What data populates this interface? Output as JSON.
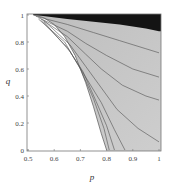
{
  "chart_data": {
    "type": "heatmap",
    "subtype": "contour",
    "title": "",
    "xlabel": "p",
    "ylabel": "q",
    "xlim": [
      0.5,
      1.0
    ],
    "ylim": [
      0.0,
      1.0
    ],
    "xticks": [
      "0.5",
      "0.6",
      "0.7",
      "0.8",
      "0.9",
      "1"
    ],
    "yticks": [
      "0",
      "0.2",
      "0.4",
      "0.6",
      "0.8",
      "1"
    ],
    "grid": false,
    "legend": null,
    "regions": [
      {
        "name": "empty-region",
        "color": "#ffffff",
        "description": "white region left of boundary curve"
      },
      {
        "name": "filled-region",
        "color": "#c4c4c4",
        "description": "gray contour-filled region"
      },
      {
        "name": "top-band",
        "color": "#141414",
        "description": "black band near q=1"
      }
    ],
    "boundary_curve": {
      "p": [
        0.52,
        0.56,
        0.6,
        0.64,
        0.68,
        0.72,
        0.75,
        0.78,
        0.8
      ],
      "q": [
        1.0,
        0.98,
        0.93,
        0.84,
        0.7,
        0.5,
        0.32,
        0.12,
        0.0
      ]
    },
    "black_band_lower_edge": {
      "p": [
        0.55,
        0.65,
        0.75,
        0.85,
        0.95,
        1.0
      ],
      "q": [
        0.995,
        0.97,
        0.95,
        0.93,
        0.9,
        0.88
      ]
    },
    "contour_lines": [
      {
        "p": [
          0.53,
          0.65,
          0.75,
          0.85,
          0.95,
          1.0
        ],
        "q": [
          0.99,
          0.93,
          0.87,
          0.81,
          0.75,
          0.72
        ]
      },
      {
        "p": [
          0.54,
          0.65,
          0.72,
          0.8,
          0.9,
          1.0
        ],
        "q": [
          0.98,
          0.88,
          0.79,
          0.7,
          0.6,
          0.54
        ]
      },
      {
        "p": [
          0.55,
          0.65,
          0.72,
          0.78,
          0.86,
          0.95,
          1.0
        ],
        "q": [
          0.97,
          0.84,
          0.71,
          0.6,
          0.48,
          0.4,
          0.37
        ]
      },
      {
        "p": [
          0.56,
          0.66,
          0.72,
          0.78,
          0.84,
          0.92,
          1.0
        ],
        "q": [
          0.96,
          0.78,
          0.62,
          0.46,
          0.3,
          0.16,
          0.06
        ]
      },
      {
        "p": [
          0.56,
          0.66,
          0.72,
          0.78,
          0.83,
          0.87
        ],
        "q": [
          0.95,
          0.73,
          0.54,
          0.35,
          0.15,
          0.0
        ]
      },
      {
        "p": [
          0.55,
          0.65,
          0.71,
          0.76,
          0.8,
          0.83
        ],
        "q": [
          0.96,
          0.76,
          0.58,
          0.36,
          0.18,
          0.0
        ]
      },
      {
        "p": [
          0.54,
          0.64,
          0.7,
          0.75,
          0.79,
          0.81
        ],
        "q": [
          0.97,
          0.8,
          0.6,
          0.38,
          0.16,
          0.0
        ]
      }
    ]
  },
  "axes": {
    "x_label": "p",
    "y_label": "q",
    "x_ticks": [
      {
        "label": "0.5",
        "value": 0.5
      },
      {
        "label": "0.6",
        "value": 0.6
      },
      {
        "label": "0.7",
        "value": 0.7
      },
      {
        "label": "0.8",
        "value": 0.8
      },
      {
        "label": "0.9",
        "value": 0.9
      },
      {
        "label": "1",
        "value": 1.0
      }
    ],
    "y_ticks": [
      {
        "label": "0",
        "value": 0.0
      },
      {
        "label": "0.2",
        "value": 0.2
      },
      {
        "label": "0.4",
        "value": 0.4
      },
      {
        "label": "0.6",
        "value": 0.6
      },
      {
        "label": "0.8",
        "value": 0.8
      },
      {
        "label": "1",
        "value": 1.0
      }
    ]
  },
  "colors": {
    "fill": "#c4c4c4",
    "top_band": "#141414",
    "contour": "#505050",
    "frame": "#777777",
    "background": "#ffffff"
  }
}
